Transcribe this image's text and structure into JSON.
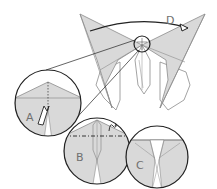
{
  "diagram": {
    "step_labels": {
      "a": "A",
      "b": "B",
      "c": "C",
      "d": "D"
    },
    "colors": {
      "paper_fill": "#d9d9d9",
      "paper_white": "#ffffff",
      "stroke": "#8c8c8c",
      "outline": "#222222"
    },
    "parts": [
      "butterfly-model",
      "detail-circle-a",
      "detail-circle-b",
      "detail-circle-c",
      "fold-arrow-d"
    ]
  }
}
